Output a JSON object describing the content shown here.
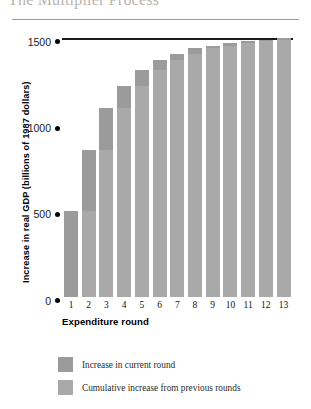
{
  "figure": {
    "title": "The Multiplier Process"
  },
  "chart_data": {
    "type": "bar",
    "title": "The Multiplier Process",
    "xlabel": "Expenditure round",
    "ylabel": "Increase in real GDP (billions of 1987 dollars)",
    "categories": [
      "1",
      "2",
      "3",
      "4",
      "5",
      "6",
      "7",
      "8",
      "9",
      "10",
      "11",
      "12",
      "13"
    ],
    "ylim": [
      0,
      1500
    ],
    "yticks": [
      0,
      500,
      1000,
      1500
    ],
    "ytick_labels": [
      "0",
      "500",
      "1000",
      "1500"
    ],
    "grid": false,
    "stacked": true,
    "reference_line": {
      "value": 1500,
      "label": "1500"
    },
    "series": [
      {
        "name": "Cumulative increase from previous rounds",
        "color": "#a9a9a9",
        "values": [
          0,
          500,
          850,
          1095,
          1220,
          1315,
          1370,
          1410,
          1440,
          1455,
          1470,
          1480,
          1490
        ]
      },
      {
        "name": "Increase in current round",
        "color": "#9b9b9b",
        "values": [
          500,
          350,
          245,
          125,
          95,
          55,
          40,
          30,
          15,
          15,
          10,
          10,
          10
        ]
      }
    ],
    "totals": [
      500,
      850,
      1095,
      1220,
      1315,
      1370,
      1410,
      1440,
      1455,
      1470,
      1480,
      1490,
      1500
    ],
    "legend": {
      "position": "bottom-left",
      "entries": [
        {
          "label": "Increase in current round",
          "color": "#9b9b9b"
        },
        {
          "label": "Cumulative increase from previous rounds",
          "color": "#a9a9a9"
        }
      ]
    }
  }
}
